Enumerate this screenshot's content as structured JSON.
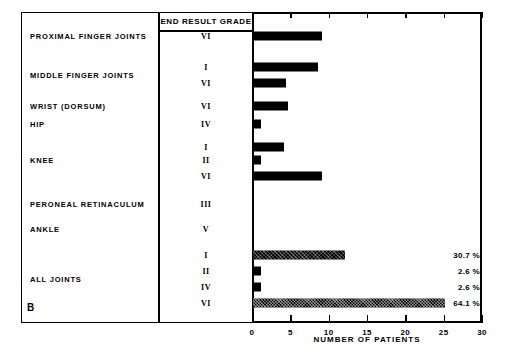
{
  "panel_letter": "B",
  "columns": {
    "joint_header": "",
    "grade_header": "END RESULT GRADE"
  },
  "axis": {
    "xlabel": "NUMBER OF PATIENTS",
    "ticks": [
      "0",
      "5",
      "10",
      "15",
      "20",
      "25",
      "30"
    ]
  },
  "groups": [
    {
      "label": "PROXIMAL FINGER JOINTS"
    },
    {
      "label": "MIDDLE FINGER JOINTS"
    },
    {
      "label": "WRIST (DORSUM)"
    },
    {
      "label": "HIP"
    },
    {
      "label": "KNEE"
    },
    {
      "label": "PERONEAL RETINACULUM"
    },
    {
      "label": "ANKLE"
    },
    {
      "label": "ALL JOINTS"
    }
  ],
  "rows": [
    {
      "group": "PROXIMAL FINGER JOINTS",
      "grade": "VI",
      "value": 9,
      "pct": ""
    },
    {
      "group": "MIDDLE FINGER JOINTS",
      "grade": "I",
      "value": 8.5,
      "pct": ""
    },
    {
      "group": "MIDDLE FINGER JOINTS",
      "grade": "VI",
      "value": 4.3,
      "pct": ""
    },
    {
      "group": "WRIST (DORSUM)",
      "grade": "VI",
      "value": 4.6,
      "pct": ""
    },
    {
      "group": "HIP",
      "grade": "IV",
      "value": 1,
      "pct": ""
    },
    {
      "group": "KNEE",
      "grade": "I",
      "value": 4,
      "pct": ""
    },
    {
      "group": "KNEE",
      "grade": "II",
      "value": 1,
      "pct": ""
    },
    {
      "group": "KNEE",
      "grade": "VI",
      "value": 9,
      "pct": ""
    },
    {
      "group": "PERONEAL RETINACULUM",
      "grade": "III",
      "value": 0,
      "pct": ""
    },
    {
      "group": "ANKLE",
      "grade": "V",
      "value": 0,
      "pct": ""
    },
    {
      "group": "ALL JOINTS",
      "grade": "I",
      "value": 12,
      "pct": "30.7 %"
    },
    {
      "group": "ALL JOINTS",
      "grade": "II",
      "value": 1,
      "pct": "2.6 %"
    },
    {
      "group": "ALL JOINTS",
      "grade": "IV",
      "value": 1,
      "pct": "2.6 %"
    },
    {
      "group": "ALL JOINTS",
      "grade": "VI",
      "value": 25,
      "pct": "64.1 %"
    }
  ],
  "chart_data": {
    "type": "bar",
    "orientation": "horizontal",
    "title": "",
    "panel": "B",
    "xlabel": "NUMBER OF PATIENTS",
    "ylabel": "",
    "xlim": [
      0,
      30
    ],
    "xticks": [
      0,
      5,
      10,
      15,
      20,
      25,
      30
    ],
    "grid": false,
    "legend": null,
    "group_column_header": "END RESULT GRADE",
    "categories": [
      "PROXIMAL FINGER JOINTS - VI",
      "MIDDLE FINGER JOINTS - I",
      "MIDDLE FINGER JOINTS - VI",
      "WRIST (DORSUM) - VI",
      "HIP - IV",
      "KNEE - I",
      "KNEE - II",
      "KNEE - VI",
      "PERONEAL RETINACULUM - III",
      "ANKLE - V",
      "ALL JOINTS - I",
      "ALL JOINTS - II",
      "ALL JOINTS - IV",
      "ALL JOINTS - VI"
    ],
    "values": [
      9,
      8.5,
      4.3,
      4.6,
      1,
      4,
      1,
      9,
      0,
      0,
      12,
      1,
      1,
      25
    ],
    "annotations": [
      {
        "category": "ALL JOINTS - I",
        "text": "30.7 %"
      },
      {
        "category": "ALL JOINTS - II",
        "text": "2.6 %"
      },
      {
        "category": "ALL JOINTS - IV",
        "text": "2.6 %"
      },
      {
        "category": "ALL JOINTS - VI",
        "text": "64.1 %"
      }
    ]
  },
  "layout": {
    "rows_y": [
      36,
      67,
      83,
      106,
      124,
      147,
      160,
      176,
      204,
      229,
      255,
      271,
      287,
      303
    ],
    "group_label_y": [
      36,
      75,
      106,
      124,
      160,
      204,
      229,
      279
    ],
    "hatched_rows": [
      10,
      13
    ],
    "px_per_unit": 7.6667,
    "plot_left": 252,
    "plot_top": 12,
    "plot_height": 311
  },
  "colors": {
    "bar": "#000000",
    "background": "#ffffff",
    "axis": "#000000"
  }
}
